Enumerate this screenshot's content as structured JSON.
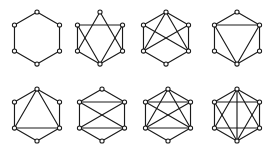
{
  "figure": {
    "title": "",
    "background_color": "#ffffff",
    "edge_color": "#1a1a1a",
    "node_fill_color": "#ffffff",
    "node_stroke_color": "#1a1a1a",
    "rows": 2,
    "columns": 4,
    "panel_count": 8,
    "vertex_count_per_graph": 6,
    "node_radius": 2.1,
    "edge_width": 1.15
  },
  "layout": {
    "hexagon_vertex_order": [
      "top",
      "upper-right",
      "lower-right",
      "bottom",
      "lower-left",
      "upper-left"
    ],
    "hexagon_vertices_unit": [
      {
        "name": "top",
        "x": 0.0,
        "y": -1.0
      },
      {
        "name": "upper-right",
        "x": 0.866,
        "y": -0.5
      },
      {
        "name": "lower-right",
        "x": 0.866,
        "y": 0.5
      },
      {
        "name": "bottom",
        "x": 0.0,
        "y": 1.0
      },
      {
        "name": "lower-left",
        "x": -0.866,
        "y": 0.5
      },
      {
        "name": "upper-left",
        "x": -0.866,
        "y": -0.5
      }
    ],
    "panel_centers": [
      {
        "index": 1,
        "cx": 37.0,
        "cy": 38.0
      },
      {
        "index": 2,
        "cx": 100.0,
        "cy": 38.0
      },
      {
        "index": 3,
        "cx": 166.0,
        "cy": 38.0
      },
      {
        "index": 4,
        "cx": 237.0,
        "cy": 38.0
      },
      {
        "index": 5,
        "cx": 37.0,
        "cy": 115.0
      },
      {
        "index": 6,
        "cx": 102.0,
        "cy": 115.0
      },
      {
        "index": 7,
        "cx": 168.0,
        "cy": 115.0
      },
      {
        "index": 8,
        "cx": 237.0,
        "cy": 115.0
      }
    ],
    "panel_radius_x": 26.0,
    "panel_radius_y": 26.0
  },
  "chart_data": {
    "type": "diagram",
    "subtype": "graph-family",
    "title": "",
    "node_labels": [
      "0",
      "1",
      "2",
      "3",
      "4",
      "5"
    ],
    "graphs": [
      {
        "index": 1,
        "name": "cycle-hexagon",
        "edge_count": 6,
        "edges": [
          [
            0,
            1
          ],
          [
            1,
            2
          ],
          [
            2,
            3
          ],
          [
            3,
            4
          ],
          [
            4,
            5
          ],
          [
            5,
            0
          ]
        ]
      },
      {
        "index": 2,
        "name": "hexagon-with-star-chords",
        "edge_count": 9,
        "edges": [
          [
            1,
            2
          ],
          [
            2,
            3
          ],
          [
            3,
            4
          ],
          [
            4,
            5
          ],
          [
            5,
            1
          ],
          [
            0,
            4
          ],
          [
            0,
            2
          ],
          [
            3,
            5
          ],
          [
            3,
            1
          ]
        ]
      },
      {
        "index": 3,
        "name": "hexagon-with-crossed-chords",
        "edge_count": 10,
        "edges": [
          [
            0,
            1
          ],
          [
            1,
            2
          ],
          [
            2,
            3
          ],
          [
            3,
            4
          ],
          [
            4,
            5
          ],
          [
            5,
            0
          ],
          [
            5,
            2
          ],
          [
            4,
            1
          ],
          [
            0,
            4
          ],
          [
            0,
            2
          ]
        ]
      },
      {
        "index": 4,
        "name": "hexagon-with-horizontal-and-two-diagonals",
        "edge_count": 9,
        "edges": [
          [
            0,
            1
          ],
          [
            1,
            2
          ],
          [
            2,
            3
          ],
          [
            3,
            4
          ],
          [
            4,
            5
          ],
          [
            5,
            0
          ],
          [
            5,
            1
          ],
          [
            5,
            3
          ],
          [
            1,
            3
          ]
        ]
      },
      {
        "index": 5,
        "name": "hexagon-with-apex-fan",
        "edge_count": 9,
        "edges": [
          [
            0,
            1
          ],
          [
            1,
            2
          ],
          [
            2,
            3
          ],
          [
            3,
            4
          ],
          [
            4,
            5
          ],
          [
            5,
            0
          ],
          [
            0,
            2
          ],
          [
            0,
            4
          ],
          [
            2,
            4
          ]
        ]
      },
      {
        "index": 6,
        "name": "hexagon-with-two-chords-and-cross",
        "edge_count": 10,
        "edges": [
          [
            0,
            1
          ],
          [
            1,
            2
          ],
          [
            2,
            3
          ],
          [
            3,
            4
          ],
          [
            4,
            5
          ],
          [
            5,
            0
          ],
          [
            5,
            1
          ],
          [
            2,
            4
          ],
          [
            5,
            2
          ],
          [
            1,
            4
          ]
        ]
      },
      {
        "index": 7,
        "name": "hexagon-with-fan-and-cross",
        "edge_count": 12,
        "edges": [
          [
            0,
            1
          ],
          [
            1,
            2
          ],
          [
            2,
            3
          ],
          [
            3,
            4
          ],
          [
            4,
            5
          ],
          [
            5,
            0
          ],
          [
            5,
            1
          ],
          [
            2,
            4
          ],
          [
            0,
            2
          ],
          [
            0,
            4
          ],
          [
            5,
            2
          ],
          [
            1,
            4
          ]
        ]
      },
      {
        "index": 8,
        "name": "hexagon-with-both-triangles-and-chord",
        "edge_count": 13,
        "edges": [
          [
            0,
            1
          ],
          [
            1,
            2
          ],
          [
            2,
            3
          ],
          [
            3,
            4
          ],
          [
            4,
            5
          ],
          [
            5,
            0
          ],
          [
            0,
            2
          ],
          [
            2,
            4
          ],
          [
            4,
            0
          ],
          [
            1,
            3
          ],
          [
            3,
            5
          ],
          [
            5,
            1
          ],
          [
            0,
            3
          ]
        ]
      }
    ]
  }
}
